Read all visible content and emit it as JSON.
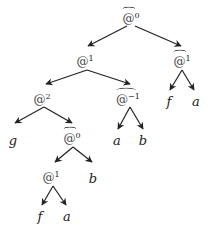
{
  "diagram": {
    "type": "application-tree",
    "edge_color": "#222222",
    "nodes": [
      {
        "id": "n0",
        "symbol": "@",
        "sup": "0",
        "hat": true,
        "x": 131,
        "y": 18
      },
      {
        "id": "n1",
        "symbol": "@",
        "sup": "1",
        "hat": false,
        "x": 85,
        "y": 61
      },
      {
        "id": "n2",
        "symbol": "@",
        "sup": "1",
        "hat": true,
        "x": 182,
        "y": 61
      },
      {
        "id": "n3",
        "symbol": "@",
        "sup": "2",
        "hat": false,
        "x": 42,
        "y": 99
      },
      {
        "id": "n4",
        "symbol": "@",
        "sup": "−1",
        "hat": true,
        "x": 128,
        "y": 99
      },
      {
        "id": "n5",
        "symbol": "f",
        "sup": "",
        "hat": false,
        "x": 169,
        "y": 101
      },
      {
        "id": "n6",
        "symbol": "a",
        "sup": "",
        "hat": false,
        "x": 196,
        "y": 101
      },
      {
        "id": "n7",
        "symbol": "g",
        "sup": "",
        "hat": false,
        "x": 13,
        "y": 140
      },
      {
        "id": "n8",
        "symbol": "@",
        "sup": "0",
        "hat": true,
        "x": 72,
        "y": 138
      },
      {
        "id": "n9",
        "symbol": "a",
        "sup": "",
        "hat": false,
        "x": 117,
        "y": 140
      },
      {
        "id": "n10",
        "symbol": "b",
        "sup": "",
        "hat": false,
        "x": 143,
        "y": 140
      },
      {
        "id": "n11",
        "symbol": "@",
        "sup": "1",
        "hat": false,
        "x": 51,
        "y": 177
      },
      {
        "id": "n12",
        "symbol": "b",
        "sup": "",
        "hat": false,
        "x": 93,
        "y": 178
      },
      {
        "id": "n13",
        "symbol": "f",
        "sup": "",
        "hat": false,
        "x": 40,
        "y": 216
      },
      {
        "id": "n14",
        "symbol": "a",
        "sup": "",
        "hat": false,
        "x": 67,
        "y": 216
      }
    ],
    "edges": [
      {
        "from": "n0",
        "to": "n1",
        "x1": 127,
        "y1": 26,
        "x2": 88,
        "y2": 46
      },
      {
        "from": "n0",
        "to": "n2",
        "x1": 135,
        "y1": 26,
        "x2": 181,
        "y2": 46
      },
      {
        "from": "n1",
        "to": "n3",
        "x1": 87,
        "y1": 70,
        "x2": 46,
        "y2": 84
      },
      {
        "from": "n1",
        "to": "n4",
        "x1": 87,
        "y1": 70,
        "x2": 130,
        "y2": 84
      },
      {
        "from": "n2",
        "to": "n5",
        "x1": 182,
        "y1": 70,
        "x2": 170,
        "y2": 90
      },
      {
        "from": "n2",
        "to": "n6",
        "x1": 182,
        "y1": 70,
        "x2": 194,
        "y2": 90
      },
      {
        "from": "n3",
        "to": "n7",
        "x1": 44,
        "y1": 107,
        "x2": 15,
        "y2": 123
      },
      {
        "from": "n3",
        "to": "n8",
        "x1": 44,
        "y1": 107,
        "x2": 72,
        "y2": 123
      },
      {
        "from": "n4",
        "to": "n9",
        "x1": 130,
        "y1": 107,
        "x2": 118,
        "y2": 129
      },
      {
        "from": "n4",
        "to": "n10",
        "x1": 130,
        "y1": 107,
        "x2": 143,
        "y2": 129
      },
      {
        "from": "n8",
        "to": "n11",
        "x1": 73,
        "y1": 147,
        "x2": 55,
        "y2": 162
      },
      {
        "from": "n8",
        "to": "n12",
        "x1": 73,
        "y1": 147,
        "x2": 92,
        "y2": 162
      },
      {
        "from": "n11",
        "to": "n13",
        "x1": 53,
        "y1": 186,
        "x2": 42,
        "y2": 205
      },
      {
        "from": "n11",
        "to": "n14",
        "x1": 53,
        "y1": 186,
        "x2": 66,
        "y2": 205
      }
    ]
  }
}
